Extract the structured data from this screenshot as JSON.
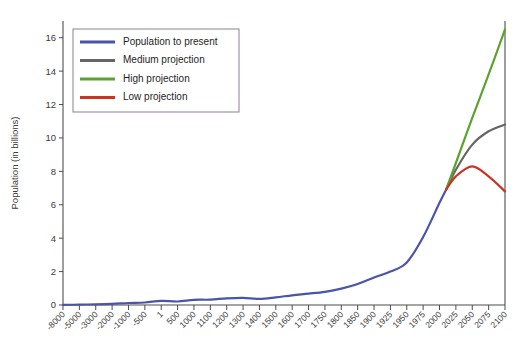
{
  "chart_data": {
    "type": "line",
    "title": "",
    "xlabel": "",
    "ylabel": "Population (in billions)",
    "ylim": [
      0,
      17
    ],
    "yticks": [
      0,
      2,
      4,
      6,
      8,
      10,
      12,
      14,
      16
    ],
    "grid": false,
    "legend_position": "top-left",
    "categories": [
      "-8000",
      "-5000",
      "-3000",
      "-2000",
      "-1000",
      "-500",
      "1",
      "500",
      "1000",
      "1100",
      "1200",
      "1300",
      "1400",
      "1500",
      "1600",
      "1700",
      "1750",
      "1800",
      "1850",
      "1900",
      "1925",
      "1950",
      "1975",
      "2000",
      "2025",
      "2050",
      "2075",
      "2100"
    ],
    "series": [
      {
        "name": "Population to present",
        "color": "#4a55a8",
        "x": [
          "-8000",
          "-5000",
          "-3000",
          "-2000",
          "-1000",
          "-500",
          "1",
          "500",
          "1000",
          "1100",
          "1200",
          "1300",
          "1400",
          "1500",
          "1600",
          "1700",
          "1750",
          "1800",
          "1850",
          "1900",
          "1925",
          "1950",
          "1975",
          "2000",
          "2010"
        ],
        "values": [
          0.005,
          0.02,
          0.04,
          0.07,
          0.12,
          0.15,
          0.25,
          0.21,
          0.31,
          0.32,
          0.4,
          0.43,
          0.37,
          0.46,
          0.58,
          0.68,
          0.79,
          0.98,
          1.26,
          1.65,
          2.0,
          2.55,
          4.07,
          6.12,
          6.9
        ]
      },
      {
        "name": "Medium projection",
        "color": "#666666",
        "x": [
          "2010",
          "2025",
          "2050",
          "2075",
          "2100"
        ],
        "values": [
          6.9,
          8.1,
          9.6,
          10.4,
          10.8
        ]
      },
      {
        "name": "High projection",
        "color": "#5ba32e",
        "x": [
          "2010",
          "2025",
          "2050",
          "2075",
          "2100"
        ],
        "values": [
          6.9,
          8.5,
          11.2,
          13.8,
          16.5
        ]
      },
      {
        "name": "Low projection",
        "color": "#cc3322",
        "x": [
          "2010",
          "2025",
          "2050",
          "2075",
          "2100"
        ],
        "values": [
          6.9,
          7.7,
          8.3,
          7.7,
          6.8
        ]
      }
    ]
  },
  "legend": {
    "items": [
      {
        "label": "Population to present",
        "color": "#4a55a8"
      },
      {
        "label": "Medium projection",
        "color": "#666666"
      },
      {
        "label": "High projection",
        "color": "#5ba32e"
      },
      {
        "label": "Low projection",
        "color": "#cc3322"
      }
    ]
  }
}
